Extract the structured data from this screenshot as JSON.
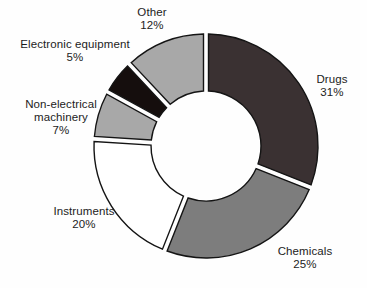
{
  "chart_data": {
    "type": "pie",
    "subtype": "donut",
    "title": "",
    "legend": "none",
    "labels_position": "outside",
    "start_angle_deg": 0,
    "direction": "clockwise",
    "categories": [
      "Drugs",
      "Chemicals",
      "Instruments",
      "Non-electrical machinery",
      "Electronic equipment",
      "Other"
    ],
    "values": [
      31,
      25,
      20,
      7,
      5,
      12
    ],
    "outline_color": "#141414",
    "slices": [
      {
        "id": "drugs",
        "label": "Drugs",
        "pct": "31%",
        "value": 31,
        "color": "#3a3132"
      },
      {
        "id": "chemicals",
        "label": "Chemicals",
        "pct": "25%",
        "value": 25,
        "color": "#7d7d7d"
      },
      {
        "id": "instruments",
        "label": "Instruments",
        "pct": "20%",
        "value": 20,
        "color": "#ffffff"
      },
      {
        "id": "non-electrical-machinery",
        "label": "Non-electrical machinery",
        "pct": "7%",
        "value": 7,
        "color": "#a8a8a8"
      },
      {
        "id": "electronic-equipment",
        "label": "Electronic equipment",
        "pct": "5%",
        "value": 5,
        "color": "#150e0d"
      },
      {
        "id": "other",
        "label": "Other",
        "pct": "12%",
        "value": 12,
        "color": "#a8a8a8"
      }
    ]
  }
}
